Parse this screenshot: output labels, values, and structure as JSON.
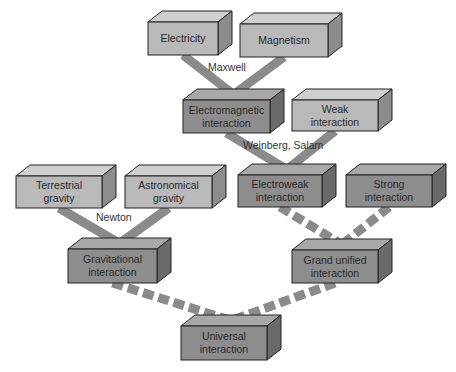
{
  "colors": {
    "light_box_front": "#b9b9b9",
    "light_box_top": "#cfcfcf",
    "light_box_side": "#8c8c8c",
    "dark_box_front": "#8d8d8d",
    "dark_box_top": "#a8a8a8",
    "dark_box_side": "#6a6a6a",
    "connector": "#8a8a8a",
    "outline": "#222222"
  },
  "boxes": [
    {
      "id": "electricity",
      "label": "Electricity",
      "x": 148,
      "y": 22,
      "w": 70,
      "h": 33,
      "tone": "light"
    },
    {
      "id": "magnetism",
      "label": "Magnetism",
      "x": 240,
      "y": 24,
      "w": 88,
      "h": 33,
      "tone": "light"
    },
    {
      "id": "electromagnetic",
      "label": "Electromagnetic interaction",
      "x": 183,
      "y": 100,
      "w": 87,
      "h": 33,
      "tone": "dark"
    },
    {
      "id": "weak",
      "label": "Weak interaction",
      "x": 292,
      "y": 100,
      "w": 86,
      "h": 31,
      "tone": "light"
    },
    {
      "id": "terrestrial",
      "label": "Terrestrial gravity",
      "x": 16,
      "y": 176,
      "w": 86,
      "h": 32,
      "tone": "light"
    },
    {
      "id": "astronomical",
      "label": "Astronomical gravity",
      "x": 125,
      "y": 176,
      "w": 87,
      "h": 32,
      "tone": "light"
    },
    {
      "id": "electroweak",
      "label": "Electroweak interaction",
      "x": 238,
      "y": 175,
      "w": 84,
      "h": 32,
      "tone": "dark"
    },
    {
      "id": "strong",
      "label": "Strong interaction",
      "x": 346,
      "y": 175,
      "w": 86,
      "h": 32,
      "tone": "dark"
    },
    {
      "id": "gravitational",
      "label": "Gravitational interaction",
      "x": 68,
      "y": 249,
      "w": 89,
      "h": 34,
      "tone": "dark"
    },
    {
      "id": "grand_unified",
      "label": "Grand unified interaction",
      "x": 292,
      "y": 250,
      "w": 86,
      "h": 33,
      "tone": "dark"
    },
    {
      "id": "universal",
      "label": "Universal interaction",
      "x": 181,
      "y": 326,
      "w": 86,
      "h": 34,
      "tone": "dark"
    }
  ],
  "connectors": [
    {
      "from": "electricity",
      "to": "electromagnetic",
      "style": "solid"
    },
    {
      "from": "magnetism",
      "to": "electromagnetic",
      "style": "solid"
    },
    {
      "from": "electromagnetic",
      "to": "electroweak",
      "style": "solid"
    },
    {
      "from": "weak",
      "to": "electroweak",
      "style": "solid"
    },
    {
      "from": "terrestrial",
      "to": "gravitational",
      "style": "solid"
    },
    {
      "from": "astronomical",
      "to": "gravitational",
      "style": "solid"
    },
    {
      "from": "electroweak",
      "to": "grand_unified",
      "style": "dashed"
    },
    {
      "from": "strong",
      "to": "grand_unified",
      "style": "dashed"
    },
    {
      "from": "gravitational",
      "to": "universal",
      "style": "dashed"
    },
    {
      "from": "grand_unified",
      "to": "universal",
      "style": "dashed"
    }
  ],
  "connector_labels": [
    {
      "text": "Maxwell",
      "x": 208,
      "y": 61
    },
    {
      "text": "Weinberg, Salam",
      "x": 243,
      "y": 139
    },
    {
      "text": "Newton",
      "x": 96,
      "y": 211
    }
  ]
}
